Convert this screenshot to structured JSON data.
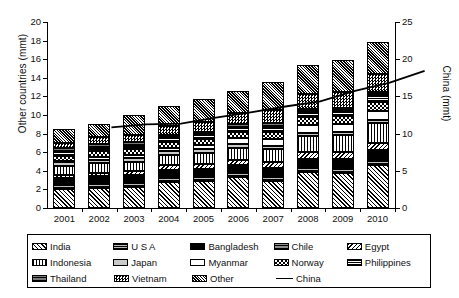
{
  "chart_data": {
    "type": "bar",
    "stacked": true,
    "title": "",
    "xlabel": "",
    "ylabel": "Other countries (mmt)",
    "y2label": "China (mmt)",
    "ylim": [
      0,
      20
    ],
    "yticks": [
      0,
      2,
      4,
      6,
      8,
      10,
      12,
      14,
      16,
      18,
      20
    ],
    "y2lim": [
      0,
      25
    ],
    "y2ticks": [
      0,
      5,
      10,
      15,
      20,
      25
    ],
    "grid": false,
    "legend_position": "bottom",
    "categories": [
      "2001",
      "2002",
      "2003",
      "2004",
      "2005",
      "2006",
      "2007",
      "2008",
      "2009",
      "2010"
    ],
    "series": [
      {
        "name": "India",
        "pattern": "diagonal-hatch-up",
        "values": [
          2.0,
          2.2,
          2.3,
          2.8,
          2.9,
          3.3,
          2.9,
          3.9,
          3.8,
          4.6
        ]
      },
      {
        "name": "U S A",
        "pattern": "horizontal-lines-gray",
        "values": [
          0.5,
          0.5,
          0.5,
          0.5,
          0.5,
          0.5,
          0.5,
          0.5,
          0.5,
          0.5
        ]
      },
      {
        "name": "Bangladesh",
        "pattern": "solid-black",
        "values": [
          0.4,
          0.4,
          0.5,
          0.5,
          0.5,
          0.5,
          0.6,
          0.6,
          0.7,
          0.8
        ]
      },
      {
        "name": "Chile",
        "pattern": "horizontal-lines-dark",
        "values": [
          0.3,
          0.3,
          0.3,
          0.3,
          0.3,
          0.3,
          0.3,
          0.3,
          0.3,
          0.3
        ]
      },
      {
        "name": "Egypt",
        "pattern": "diagonal-hatch-down",
        "values": [
          0.4,
          0.4,
          0.4,
          0.5,
          0.5,
          0.6,
          0.6,
          0.7,
          0.7,
          0.8
        ]
      },
      {
        "name": "Indonesia",
        "pattern": "vertical-lines",
        "values": [
          0.9,
          1.0,
          1.0,
          1.1,
          1.2,
          1.3,
          1.4,
          1.7,
          1.8,
          2.1
        ]
      },
      {
        "name": "Japan",
        "pattern": "light-gray-solid",
        "values": [
          0.4,
          0.4,
          0.4,
          0.4,
          0.4,
          0.4,
          0.4,
          0.4,
          0.4,
          0.4
        ]
      },
      {
        "name": "Myanmar",
        "pattern": "white-solid",
        "values": [
          0.2,
          0.3,
          0.3,
          0.4,
          0.5,
          0.6,
          0.7,
          0.8,
          0.8,
          0.9
        ]
      },
      {
        "name": "Norway",
        "pattern": "checkerboard-coarse",
        "values": [
          0.5,
          0.6,
          0.6,
          0.6,
          0.6,
          0.7,
          0.8,
          0.9,
          0.9,
          1.0
        ]
      },
      {
        "name": "Philippines",
        "pattern": "dense-horizontal",
        "values": [
          0.4,
          0.4,
          0.4,
          0.4,
          0.4,
          0.4,
          0.5,
          0.5,
          0.5,
          0.7
        ]
      },
      {
        "name": "Thailand",
        "pattern": "horizontal-lines-mid",
        "values": [
          0.4,
          0.4,
          0.4,
          0.4,
          0.4,
          0.4,
          0.4,
          0.4,
          0.4,
          0.4
        ]
      },
      {
        "name": "Vietnam",
        "pattern": "checkerboard-fine",
        "values": [
          0.6,
          0.7,
          0.8,
          0.9,
          1.1,
          1.2,
          1.4,
          1.6,
          1.7,
          1.9
        ]
      },
      {
        "name": "Other",
        "pattern": "dense-diagonal",
        "values": [
          1.5,
          1.4,
          2.1,
          2.2,
          2.4,
          2.4,
          3.0,
          3.1,
          3.4,
          3.5
        ]
      }
    ],
    "bar_totals": [
      8.5,
      9.0,
      9.8,
      11.0,
      11.7,
      12.6,
      13.5,
      15.4,
      15.9,
      17.9
    ],
    "line_series": {
      "name": "China",
      "axis": "right",
      "values": [
        13.8,
        14.2,
        14.3,
        15.1,
        15.8,
        16.6,
        17.3,
        18.7,
        19.8,
        21.4
      ]
    }
  },
  "axes": {
    "left": {
      "title": "Other countries (mmt)",
      "ticks": [
        "20",
        "18",
        "16",
        "14",
        "12",
        "10",
        "8",
        "6",
        "4",
        "2",
        "0"
      ]
    },
    "right": {
      "title": "China (mmt)",
      "ticks": [
        "25",
        "20",
        "15",
        "10",
        "5",
        "0"
      ]
    },
    "x": {
      "ticks": [
        "2001",
        "2002",
        "2003",
        "2004",
        "2005",
        "2006",
        "2007",
        "2008",
        "2009",
        "2010"
      ]
    }
  },
  "legend": {
    "rows": [
      [
        {
          "label": "India",
          "swatch": "p-india"
        },
        {
          "label": "U S A",
          "swatch": "p-usa"
        },
        {
          "label": "Bangladesh",
          "swatch": "p-bangladesh"
        },
        {
          "label": "Chile",
          "swatch": "p-chile"
        },
        {
          "label": "Egypt",
          "swatch": "p-egypt"
        }
      ],
      [
        {
          "label": "Indonesia",
          "swatch": "p-indonesia"
        },
        {
          "label": "Japan",
          "swatch": "p-japan"
        },
        {
          "label": "Myanmar",
          "swatch": "p-myanmar"
        },
        {
          "label": "Norway",
          "swatch": "p-norway"
        },
        {
          "label": "Philippines",
          "swatch": "p-philippines"
        }
      ],
      [
        {
          "label": "Thailand",
          "swatch": "p-thailand"
        },
        {
          "label": "Vietnam",
          "swatch": "p-vietnam"
        },
        {
          "label": "Other",
          "swatch": "p-other"
        },
        {
          "label": "China",
          "swatch": "line"
        }
      ]
    ]
  },
  "colors": {
    "foreground": "#000000",
    "background": "#ffffff",
    "gray_light": "#c9c9c9",
    "gray_mid": "#8d8d8d"
  }
}
